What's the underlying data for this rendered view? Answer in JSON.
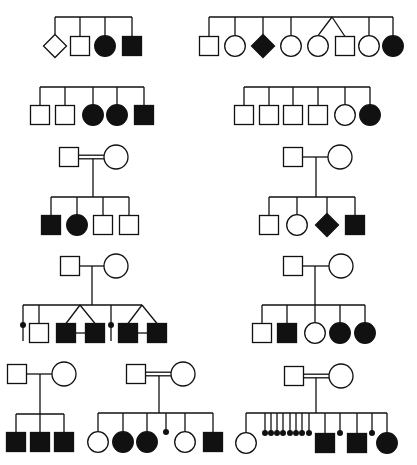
{
  "figure": {
    "title": "",
    "colors": {
      "line": "#111111",
      "affected": "#111111",
      "unaffected": "#ffffff",
      "background": "#ffffff"
    },
    "symbol_size": 19,
    "pedigrees": [
      {
        "id": "ped-1",
        "parents": null,
        "sibship_y": 17,
        "child_y": 46,
        "children": [
          {
            "x": 55,
            "sex": "unknown",
            "affected": false
          },
          {
            "x": 80,
            "sex": "male",
            "affected": false
          },
          {
            "x": 105,
            "sex": "female",
            "affected": true
          },
          {
            "x": 132,
            "sex": "male",
            "affected": true
          }
        ]
      },
      {
        "id": "ped-2",
        "parents": null,
        "sibship_y": 17,
        "child_y": 46,
        "children": [
          {
            "x": 209,
            "sex": "male",
            "affected": false
          },
          {
            "x": 235,
            "sex": "female",
            "affected": false
          },
          {
            "x": 263,
            "sex": "unknown",
            "affected": true
          },
          {
            "x": 291,
            "sex": "female",
            "affected": false
          },
          {
            "x": 318,
            "sex": "female",
            "affected": false,
            "twin": "dz-a",
            "twin_apex": 332
          },
          {
            "x": 345,
            "sex": "male",
            "affected": false,
            "twin": "dz-a",
            "twin_apex": 332
          },
          {
            "x": 369,
            "sex": "female",
            "affected": false
          },
          {
            "x": 393,
            "sex": "female",
            "affected": true
          }
        ]
      },
      {
        "id": "ped-3",
        "parents": null,
        "sibship_y": 87,
        "child_y": 115,
        "children": [
          {
            "x": 40,
            "sex": "male",
            "affected": false
          },
          {
            "x": 65,
            "sex": "male",
            "affected": false
          },
          {
            "x": 93,
            "sex": "female",
            "affected": true
          },
          {
            "x": 117,
            "sex": "female",
            "affected": true
          },
          {
            "x": 144,
            "sex": "male",
            "affected": true
          }
        ]
      },
      {
        "id": "ped-4",
        "parents": null,
        "sibship_y": 87,
        "child_y": 115,
        "children": [
          {
            "x": 244,
            "sex": "male",
            "affected": false
          },
          {
            "x": 269,
            "sex": "male",
            "affected": false
          },
          {
            "x": 293,
            "sex": "male",
            "affected": false
          },
          {
            "x": 318,
            "sex": "male",
            "affected": false
          },
          {
            "x": 345,
            "sex": "female",
            "affected": false
          },
          {
            "x": 370,
            "sex": "female",
            "affected": true
          }
        ]
      },
      {
        "id": "ped-5",
        "parents": {
          "father_x": 69,
          "mother_x": 116,
          "y": 157,
          "consanguineous": true,
          "drop_x": 93
        },
        "sibship_y": 197,
        "child_y": 225,
        "children": [
          {
            "x": 51,
            "sex": "male",
            "affected": true
          },
          {
            "x": 77,
            "sex": "female",
            "affected": true
          },
          {
            "x": 103,
            "sex": "male",
            "affected": false
          },
          {
            "x": 129,
            "sex": "male",
            "affected": false
          }
        ]
      },
      {
        "id": "ped-6",
        "parents": {
          "father_x": 293,
          "mother_x": 340,
          "y": 157,
          "consanguineous": false,
          "drop_x": 316
        },
        "sibship_y": 197,
        "child_y": 225,
        "children": [
          {
            "x": 269,
            "sex": "male",
            "affected": false
          },
          {
            "x": 297,
            "sex": "female",
            "affected": false
          },
          {
            "x": 327,
            "sex": "unknown",
            "affected": true
          },
          {
            "x": 355,
            "sex": "male",
            "affected": true
          }
        ]
      },
      {
        "id": "ped-7",
        "parents": {
          "father_x": 70,
          "mother_x": 116,
          "y": 266,
          "consanguineous": false,
          "drop_x": 92
        },
        "sibship_y": 305,
        "child_y": 333,
        "children": [
          {
            "x": 23,
            "sex": "miscarriage",
            "affected": true
          },
          {
            "x": 39,
            "sex": "male",
            "affected": false
          },
          {
            "x": 66,
            "sex": "male",
            "affected": true,
            "twin": "mz-a",
            "twin_apex": 80
          },
          {
            "x": 95,
            "sex": "male",
            "affected": true,
            "twin": "mz-a",
            "twin_apex": 80
          },
          {
            "x": 111,
            "sex": "miscarriage",
            "affected": true
          },
          {
            "x": 128,
            "sex": "male",
            "affected": true,
            "twin": "mz-b",
            "twin_apex": 142
          },
          {
            "x": 157,
            "sex": "male",
            "affected": true,
            "twin": "mz-b",
            "twin_apex": 142
          }
        ],
        "mz_bars": [
          {
            "x1": 75,
            "x2": 86,
            "y": 333
          },
          {
            "x1": 137,
            "x2": 148,
            "y": 333
          }
        ]
      },
      {
        "id": "ped-8",
        "parents": {
          "father_x": 293,
          "mother_x": 341,
          "y": 266,
          "consanguineous": false,
          "drop_x": 315
        },
        "sibship_y": 305,
        "child_y": 333,
        "children": [
          {
            "x": 262,
            "sex": "male",
            "affected": false
          },
          {
            "x": 287,
            "sex": "male",
            "affected": true
          },
          {
            "x": 315,
            "sex": "female",
            "affected": false
          },
          {
            "x": 340,
            "sex": "female",
            "affected": true
          },
          {
            "x": 365,
            "sex": "female",
            "affected": true
          }
        ]
      },
      {
        "id": "ped-9",
        "parents": {
          "father_x": 17,
          "mother_x": 64,
          "y": 374,
          "consanguineous": false,
          "drop_x": 40
        },
        "sibship_y": 414,
        "child_y": 442,
        "children": [
          {
            "x": 16,
            "sex": "male",
            "affected": true
          },
          {
            "x": 40,
            "sex": "male",
            "affected": true
          },
          {
            "x": 64,
            "sex": "male",
            "affected": true
          }
        ]
      },
      {
        "id": "ped-10",
        "parents": {
          "father_x": 136,
          "mother_x": 183,
          "y": 374,
          "consanguineous": true,
          "drop_x": 159
        },
        "sibship_y": 413,
        "child_y": 442,
        "children": [
          {
            "x": 98,
            "sex": "female",
            "affected": false
          },
          {
            "x": 123,
            "sex": "female",
            "affected": true
          },
          {
            "x": 147,
            "sex": "female",
            "affected": true
          },
          {
            "x": 166,
            "sex": "miscarriage",
            "affected": true
          },
          {
            "x": 185,
            "sex": "female",
            "affected": false
          },
          {
            "x": 213,
            "sex": "male",
            "affected": true
          }
        ]
      },
      {
        "id": "ped-11",
        "parents": {
          "father_x": 294,
          "mother_x": 341,
          "y": 376,
          "consanguineous": true,
          "drop_x": 316
        },
        "sibship_y": 413,
        "child_y": 443,
        "children": [
          {
            "x": 246,
            "sex": "female",
            "affected": false
          },
          {
            "x": 265,
            "sex": "miscarriage",
            "affected": true
          },
          {
            "x": 271,
            "sex": "miscarriage",
            "affected": true
          },
          {
            "x": 277,
            "sex": "miscarriage",
            "affected": true
          },
          {
            "x": 283,
            "sex": "miscarriage",
            "affected": true
          },
          {
            "x": 290,
            "sex": "miscarriage",
            "affected": true
          },
          {
            "x": 296,
            "sex": "miscarriage",
            "affected": true
          },
          {
            "x": 302,
            "sex": "miscarriage",
            "affected": true
          },
          {
            "x": 309,
            "sex": "miscarriage",
            "affected": true
          },
          {
            "x": 325,
            "sex": "male",
            "affected": true
          },
          {
            "x": 340,
            "sex": "miscarriage",
            "affected": true
          },
          {
            "x": 357,
            "sex": "male",
            "affected": true
          },
          {
            "x": 372,
            "sex": "miscarriage",
            "affected": true
          },
          {
            "x": 387,
            "sex": "female",
            "affected": true
          }
        ]
      }
    ]
  }
}
